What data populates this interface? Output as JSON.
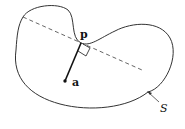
{
  "diagram": {
    "labels": {
      "point_p": "p",
      "point_a": "a",
      "set_S": "S"
    },
    "elements": {
      "boundary_curve": "closed non-convex curve S",
      "tangent_line": "dashed line through p",
      "segment": "solid segment from a to p",
      "right_angle_marker": "square at p showing perpendicularity",
      "pointer_arrow": "arrow from label S to boundary"
    },
    "colors": {
      "stroke": "#333333",
      "dashed": "#555555",
      "background": "#ffffff"
    }
  }
}
